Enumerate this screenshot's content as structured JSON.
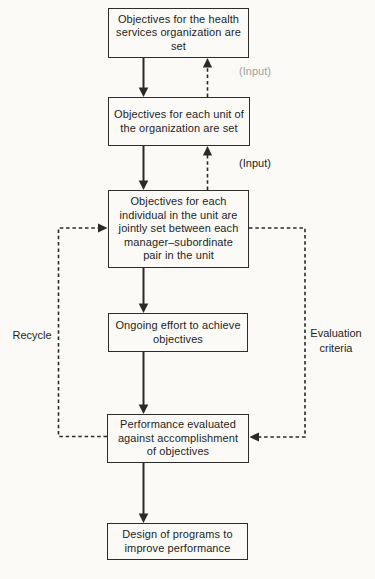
{
  "diagram": {
    "boxes": [
      {
        "id": "organization-objectives",
        "text": "Objectives for the health services organization are set"
      },
      {
        "id": "unit-objectives",
        "text": "Objectives for each unit of the organization are set"
      },
      {
        "id": "individual-objectives",
        "text": "Objectives for each individual in the unit are jointly set between each manager–subordinate pair in the unit"
      },
      {
        "id": "ongoing-effort",
        "text": "Ongoing effort to achieve objectives"
      },
      {
        "id": "performance-evaluated",
        "text": "Performance evaluated against accomplishment of objectives"
      },
      {
        "id": "design-programs",
        "text": "Design of programs to improve performance"
      }
    ],
    "labels": {
      "input_top": "(Input)",
      "input_mid": "(Input)",
      "recycle": "Recycle",
      "evaluation_criteria": "Evaluation criteria"
    },
    "colors": {
      "line": "#2a2a2a",
      "box_border": "#2d2d2d",
      "text": "#1e1e1e",
      "faded_label": "#a0a0a0",
      "background": "#fbfaf7"
    }
  }
}
